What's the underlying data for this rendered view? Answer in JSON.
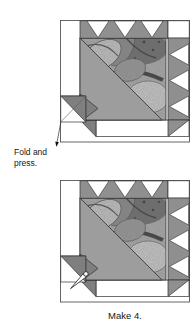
{
  "figure": {
    "kind": "quilt-block assembly diagram",
    "block_count_shown": 2
  },
  "labels": {
    "fold_press": "Fold and press.",
    "make": "Make 4."
  },
  "icons": {
    "fold_arrow": "fold-arrow-icon",
    "pin": "pin-icon"
  },
  "colors": {
    "background": "#ffffff",
    "outline": "#2f2f2f",
    "outer_square_border": "#555555",
    "medium_gray_triangle": "#9d9d9d",
    "sawtooth_gray": "#8f8f8f",
    "dark_corner_gray": "#7f7f7f",
    "fabric_base": "#adadad",
    "fabric_light": "#c9c9c9",
    "fabric_dark": "#6f6f6f",
    "text": "#161616"
  }
}
